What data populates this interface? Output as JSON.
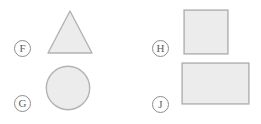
{
  "page": {
    "kind": "multiple-choice-figure-panel",
    "background_color": "#ffffff",
    "width": 261,
    "height": 124
  },
  "style": {
    "shape_fill": "#ececec",
    "shape_stroke": "#b3b3b3",
    "bubble_stroke": "#8d8d8d",
    "letter_color": "#5e5e5e"
  },
  "options": [
    {
      "letter": "F",
      "shape": "triangle",
      "shape_name": "equilateral-triangle",
      "fill": "#ececec",
      "stroke": "#b3b3b3"
    },
    {
      "letter": "G",
      "shape": "circle",
      "shape_name": "circle",
      "fill": "#ececec",
      "stroke": "#b3b3b3"
    },
    {
      "letter": "H",
      "shape": "square",
      "shape_name": "square",
      "fill": "#ececec",
      "stroke": "#b3b3b3"
    },
    {
      "letter": "J",
      "shape": "rectangle",
      "shape_name": "rectangle",
      "fill": "#ececec",
      "stroke": "#b3b3b3"
    }
  ]
}
